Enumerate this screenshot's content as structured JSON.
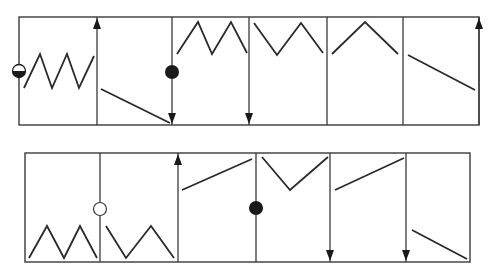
{
  "diagram": {
    "title": "",
    "colors": {
      "line": "#2a2a2a",
      "frame": "#3a3a3a",
      "dot": "#1a1a1a",
      "background": "#ffffff"
    },
    "rows": [
      {
        "id": "top-row",
        "frame": {
          "x1": 19,
          "y1": 17,
          "x2": 479,
          "y2": 125
        },
        "dividers": [
          {
            "x": 97,
            "marker": "none",
            "arrow": "up"
          },
          {
            "x": 172,
            "marker": "filled-dot",
            "marker_y": 72,
            "arrow": "down"
          },
          {
            "x": 249,
            "marker": "none",
            "arrow": "down"
          },
          {
            "x": 327,
            "marker": "none",
            "arrow": "none"
          },
          {
            "x": 403,
            "marker": "none",
            "arrow": "none"
          },
          {
            "x": 479,
            "marker": "none",
            "arrow": "up"
          }
        ],
        "left_marker": {
          "x": 19,
          "y": 71,
          "type": "half-filled-dot"
        },
        "segments": [
          {
            "cell": 1,
            "shape": "zigzag-2-peaks-rising",
            "points": [
              [
                24,
                88
              ],
              [
                40,
                54
              ],
              [
                52,
                88
              ],
              [
                67,
                54
              ],
              [
                79,
                88
              ],
              [
                94,
                56
              ]
            ]
          },
          {
            "cell": 2,
            "shape": "line-falling",
            "points": [
              [
                101,
                89
              ],
              [
                170,
                123
              ]
            ]
          },
          {
            "cell": 3,
            "shape": "zigzag-2-peaks",
            "points": [
              [
                177,
                54
              ],
              [
                198,
                22
              ],
              [
                212,
                54
              ],
              [
                231,
                22
              ],
              [
                247,
                53
              ]
            ]
          },
          {
            "cell": 4,
            "shape": "v-peak",
            "points": [
              [
                254,
                23
              ],
              [
                277,
                55
              ],
              [
                301,
                23
              ],
              [
                323,
                53
              ]
            ]
          },
          {
            "cell": 5,
            "shape": "single-peak",
            "points": [
              [
                332,
                54
              ],
              [
                365,
                22
              ],
              [
                398,
                54
              ]
            ]
          },
          {
            "cell": 6,
            "shape": "line-falling",
            "points": [
              [
                408,
                55
              ],
              [
                475,
                90
              ]
            ]
          }
        ]
      },
      {
        "id": "bottom-row",
        "frame": {
          "x1": 25,
          "y1": 153,
          "x2": 470,
          "y2": 262
        },
        "dividers": [
          {
            "x": 100,
            "marker": "open-circle",
            "marker_y": 209,
            "arrow": "none"
          },
          {
            "x": 178,
            "marker": "none",
            "arrow": "up"
          },
          {
            "x": 256,
            "marker": "filled-dot",
            "marker_y": 208,
            "arrow": "none"
          },
          {
            "x": 330,
            "marker": "none",
            "arrow": "down"
          },
          {
            "x": 406,
            "marker": "none",
            "arrow": "down"
          }
        ],
        "segments": [
          {
            "cell": 1,
            "shape": "zigzag-2-peaks-rising",
            "points": [
              [
                29,
                258
              ],
              [
                47,
                226
              ],
              [
                64,
                258
              ],
              [
                80,
                226
              ],
              [
                97,
                258
              ]
            ]
          },
          {
            "cell": 2,
            "shape": "w-zigzag",
            "points": [
              [
                106,
                226
              ],
              [
                126,
                258
              ],
              [
                151,
                226
              ],
              [
                174,
                258
              ]
            ]
          },
          {
            "cell": 3,
            "shape": "line-rising",
            "points": [
              [
                182,
                190
              ],
              [
                252,
                159
              ]
            ]
          },
          {
            "cell": 4,
            "shape": "v-dip",
            "points": [
              [
                262,
                157
              ],
              [
                290,
                190
              ],
              [
                328,
                157
              ]
            ]
          },
          {
            "cell": 5,
            "shape": "line-rising",
            "points": [
              [
                335,
                190
              ],
              [
                404,
                158
              ]
            ]
          },
          {
            "cell": 6,
            "shape": "line-falling",
            "points": [
              [
                412,
                230
              ],
              [
                467,
                259
              ]
            ]
          }
        ]
      }
    ]
  }
}
